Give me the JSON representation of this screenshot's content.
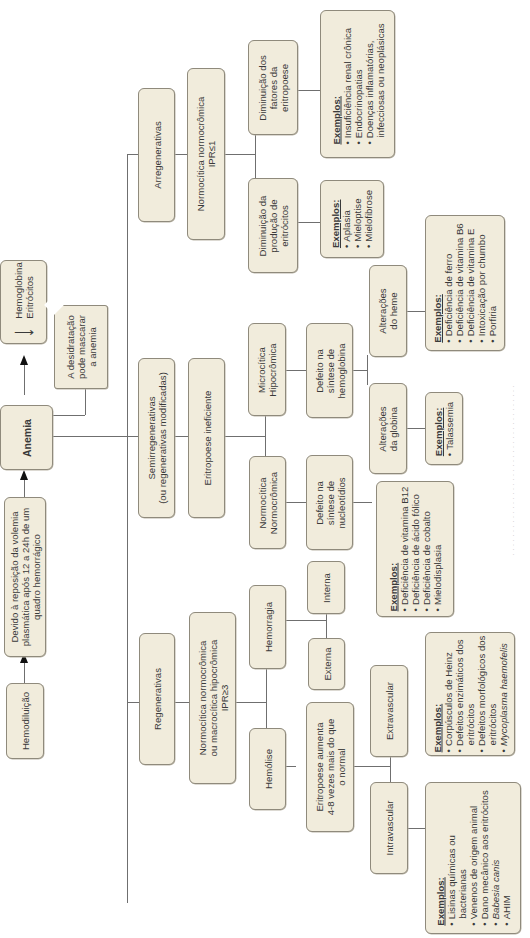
{
  "diagram": {
    "title": "Anemia",
    "orientation": "rotated -90deg (text reads bottom-to-top)",
    "root": {
      "label": "Anemia"
    },
    "upstream": {
      "hemodilution": "Hemodiluição",
      "cause": "Devido à reposição da volemia plasmática após 12 a 24h de um quadro hemorrágico",
      "cause_lines": [
        "Devido à reposição da volemia",
        "plasmática após 12 a 24h de um",
        "quadro hemorrágico"
      ]
    },
    "definition": {
      "arrow": "↓",
      "lines": [
        "Hemoglobina",
        "Eritrócitos"
      ]
    },
    "note": {
      "lines": [
        "A desidratação",
        "pode mascarar",
        "a anemia"
      ]
    },
    "branches": {
      "arregenerativas": {
        "label": "Arregenerativas",
        "morphology": [
          "Normocítica normocrômica",
          "IPR≤1"
        ],
        "decreased_factors": {
          "label": [
            "Diminuição dos",
            "fatores da",
            "eritropoese"
          ],
          "examples_title": "Exemplos:",
          "examples": [
            "Insuficiência renal crônica",
            "Endocrinopatias",
            "Doenças inflamatórias,",
            "infecciosas ou neoplásicas"
          ]
        },
        "decreased_production": {
          "label": [
            "Diminuição da",
            "produção de",
            "eritrócitos"
          ],
          "examples_title": "Exemplos:",
          "examples": [
            "Aplasia",
            "Mieloptise",
            "Mielofibrose"
          ]
        }
      },
      "semirregenerativas": {
        "label": [
          "Semirregenerativas",
          "(ou regenerativas modificadas)"
        ],
        "mechanism": "Eritropoese ineficiente",
        "microcitica": {
          "label": [
            "Microcítica",
            "Hipocrômica"
          ],
          "defect": [
            "Defeito na",
            "síntese de",
            "hemoglobina"
          ],
          "heme": {
            "label": [
              "Alterações",
              "do heme"
            ],
            "examples_title": "Exemplos:",
            "examples": [
              "Deficiência de ferro",
              "Deficiência de vitamina B6",
              "Deficiência de vitamina E",
              "Intoxicação por chumbo",
              "Porfiria"
            ]
          },
          "globina": {
            "label": [
              "Alterações",
              "da globina"
            ],
            "examples_title": "Exemplos:",
            "examples": [
              "Talassemia"
            ]
          }
        },
        "normocitica": {
          "label": [
            "Normocítica",
            "Normocrômica"
          ],
          "defect": [
            "Defeito na",
            "síntese de",
            "nucleotídios"
          ],
          "examples_title": "Exemplos:",
          "examples": [
            "Deficiência de vitamina B12",
            "Deficiência de ácido fólico",
            "Deficiência de cobalto",
            "Mielodisplasia"
          ]
        }
      },
      "regenerativas": {
        "label": "Regenerativas",
        "morphology": [
          "Normocítica normocrômica",
          "ou macrocítica hipocrômica",
          "IPR≥3"
        ],
        "hemorragia": {
          "label": "Hemorragia",
          "interna": "Interna",
          "externa": "Externa"
        },
        "hemolise": {
          "label": "Hemólise",
          "response": [
            "Eritropoese aumenta",
            "4-8 vezes mais do que",
            "o normal"
          ],
          "extravascular": {
            "label": "Extravascular",
            "examples_title": "Exemplos:",
            "examples": [
              "Corpúsculos de Heinz",
              "Defeitos enzimáticos dos",
              "eritrócitos",
              "Defeitos morfológicos dos",
              "eritrócitos",
              "Mycoplasma haemofelis"
            ],
            "bullets": [
              true,
              true,
              false,
              true,
              false,
              true
            ],
            "italic": [
              false,
              false,
              false,
              false,
              false,
              true
            ]
          },
          "intravascular": {
            "label": "Intravascular",
            "examples_title": "Exemplos:",
            "examples": [
              "Lisinas químicas ou",
              "bacterianas",
              "Venenos de origem animal",
              "Dano mecânico aos eritrócitos",
              "Babesia canis",
              "AHIM"
            ],
            "bullets": [
              true,
              false,
              true,
              true,
              true,
              true
            ],
            "italic": [
              false,
              false,
              false,
              false,
              true,
              false
            ]
          }
        }
      }
    },
    "caption": "· · · · · · · · · · · · · · · · · · · · · · · · · · · · · · · · · · · · ·"
  },
  "colors": {
    "box_fill": "#f1ecdc",
    "box_border": "#8f8a7c",
    "connector": "#6f6f6f",
    "arrow": "#111111",
    "text": "#3a3a3a"
  }
}
